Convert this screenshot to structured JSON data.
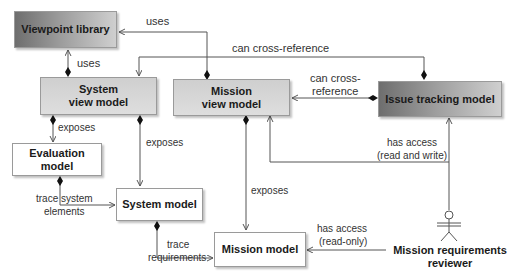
{
  "diagram": {
    "type": "uml-class-diagram",
    "nodes": [
      {
        "id": "viewpoint_library",
        "label": "Viewpoint library",
        "style": "dark"
      },
      {
        "id": "system_view_model",
        "label_line1": "System",
        "label_line2": "view model",
        "style": "mid"
      },
      {
        "id": "mission_view_model",
        "label_line1": "Mission",
        "label_line2": "view model",
        "style": "mid"
      },
      {
        "id": "issue_tracking_model",
        "label": "Issue tracking model",
        "style": "dark"
      },
      {
        "id": "evaluation_model",
        "label": "Evaluation model",
        "style": "light"
      },
      {
        "id": "system_model",
        "label": "System model",
        "style": "light"
      },
      {
        "id": "mission_model",
        "label": "Mission model",
        "style": "light"
      }
    ],
    "actor": {
      "label_line1": "Mission requirements",
      "label_line2": "reviewer"
    },
    "edges": [
      {
        "from": "mission_view_model",
        "to": "viewpoint_library",
        "label": "uses"
      },
      {
        "from": "system_view_model",
        "to": "viewpoint_library",
        "label": "uses"
      },
      {
        "from": "issue_tracking_model",
        "to": "system_view_model",
        "label": "can cross-reference"
      },
      {
        "from": "issue_tracking_model",
        "to": "mission_view_model",
        "label_line1": "can cross-",
        "label_line2": "reference"
      },
      {
        "from": "system_view_model",
        "to": "evaluation_model",
        "label": "exposes"
      },
      {
        "from": "system_view_model",
        "to": "system_model",
        "label": "exposes"
      },
      {
        "from": "mission_view_model",
        "to": "mission_model",
        "label": "exposes"
      },
      {
        "from": "evaluation_model",
        "to": "system_model",
        "label_line1": "trace system",
        "label_line2": "elements"
      },
      {
        "from": "system_model",
        "to": "mission_model",
        "label_line1": "trace",
        "label_line2": "requirements"
      },
      {
        "from": "actor",
        "to": "issue_tracking_model",
        "label_line1": "has access",
        "label_line2": "(read and write)"
      },
      {
        "from": "actor",
        "to": "mission_view_model",
        "label": "has access (read and write)"
      },
      {
        "from": "actor",
        "to": "mission_model",
        "label_line1": "has access",
        "label_line2": "(read-only)"
      }
    ]
  },
  "labels": {
    "uses_top": "uses",
    "uses_left": "uses",
    "can_cross_reference": "can cross-reference",
    "can_cross_1": "can cross-",
    "can_cross_2": "reference",
    "exposes_eval": "exposes",
    "exposes_sys": "exposes",
    "exposes_mission": "exposes",
    "trace_system_1": "trace system",
    "trace_system_2": "elements",
    "trace_req_1": "trace",
    "trace_req_2": "requirements",
    "access_rw_1": "has access",
    "access_rw_2": "(read and write)",
    "access_ro_1": "has access",
    "access_ro_2": "(read-only)"
  },
  "colors": {
    "line": "#555555",
    "dark_box_start": "#6e6e6e",
    "dark_box_end": "#cfcfcf",
    "mid_box": "#d6d6d6",
    "light_box": "#ffffff"
  }
}
